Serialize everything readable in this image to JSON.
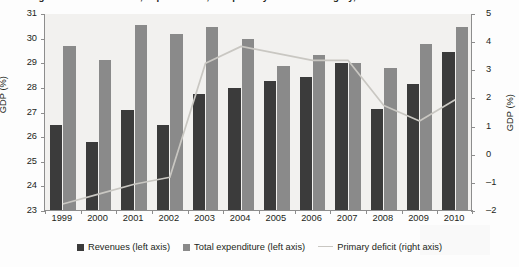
{
  "title": "Central government revenues, expenditures, and primary deficit in Hungary, 1999–2010",
  "axes": {
    "left_title": "GDP (%)",
    "right_title": "GDP (%)",
    "left_ticks": [
      "31",
      "30",
      "29",
      "28",
      "27",
      "26",
      "25",
      "24",
      "23"
    ],
    "right_ticks": [
      "5",
      "4",
      "3",
      "2",
      "1",
      "0",
      "–1",
      "–2"
    ]
  },
  "legend": {
    "items": [
      {
        "label": "Revenues (left axis)",
        "marker": "square-swatch",
        "color": "#3b3b3b"
      },
      {
        "label": "Total expenditure (left axis)",
        "marker": "square-swatch",
        "color": "#8a8a8a"
      },
      {
        "label": "Primary deficit (right axis)",
        "marker": "line-swatch",
        "color": "#c9c7c2"
      }
    ]
  },
  "chart_data": {
    "type": "bar",
    "title": "Central government revenues, expenditures, and primary deficit in Hungary, 1999–2010",
    "xlabel": "",
    "ylabel": "GDP (%)",
    "y2label": "GDP (%)",
    "ylim": [
      23,
      31
    ],
    "y2lim": [
      -2,
      5
    ],
    "grid": false,
    "legend_position": "bottom",
    "categories": [
      "1999",
      "2000",
      "2001",
      "2002",
      "2003",
      "2004",
      "2005",
      "2006",
      "2007",
      "2008",
      "2009",
      "2010"
    ],
    "series": [
      {
        "name": "Revenues (left axis)",
        "type": "bar",
        "axis": "left",
        "color": "#3b3b3b",
        "values": [
          26.45,
          25.75,
          27.05,
          26.45,
          27.7,
          27.95,
          28.25,
          28.4,
          28.95,
          27.1,
          28.1,
          29.4
        ]
      },
      {
        "name": "Total expenditure (left axis)",
        "type": "bar",
        "axis": "left",
        "color": "#8a8a8a",
        "values": [
          29.65,
          29.1,
          30.5,
          30.15,
          30.45,
          29.95,
          28.85,
          29.3,
          28.95,
          28.75,
          29.75,
          30.45
        ]
      },
      {
        "name": "Primary deficit (right axis)",
        "type": "line",
        "axis": "right",
        "color": "#c9c7c2",
        "values": [
          -1.75,
          -1.4,
          -1.05,
          -0.8,
          3.25,
          3.85,
          3.6,
          3.35,
          3.35,
          1.75,
          1.2,
          1.95
        ]
      }
    ]
  }
}
